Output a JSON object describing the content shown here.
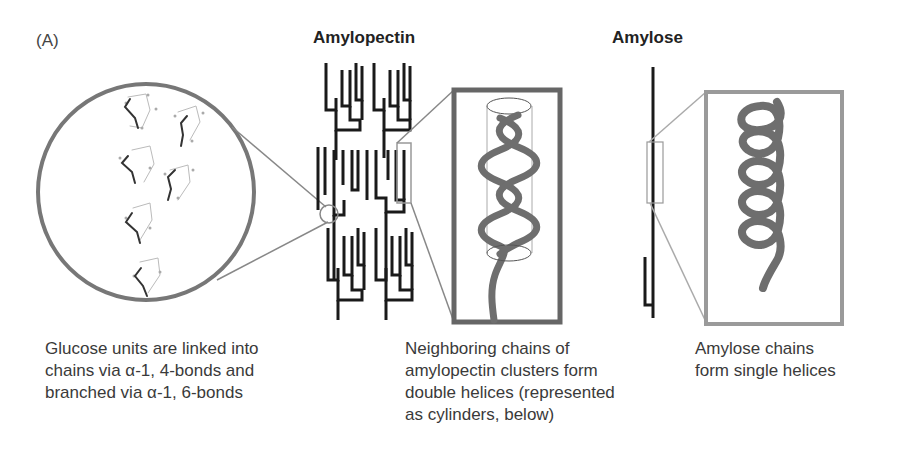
{
  "figure": {
    "panel_label": "(A)",
    "titles": {
      "amylopectin": "Amylopectin",
      "amylose": "Amylose"
    },
    "captions": {
      "glucose": [
        "Glucose units are linked into",
        "chains via α-1, 4-bonds and",
        "branched via α-1, 6-bonds"
      ],
      "neighbor": [
        "Neighboring chains of",
        "amylopectin clusters form",
        "double helices (represented",
        "as cylinders, below)"
      ],
      "amylose": [
        "Amylose chains",
        "form single helices"
      ]
    },
    "colors": {
      "chain": "#1a1a1a",
      "zoom_outline": "#777777",
      "double_helix_box": "#666666",
      "single_helix_box": "#9a9a9a",
      "helix_strand": "#6e6e6e"
    },
    "elements": {
      "glucose_zoom_circle": "magnified glucose units (molecular stick model)",
      "double_helix": "double helix inside cylinder",
      "single_helix": "amylose single helix"
    }
  }
}
